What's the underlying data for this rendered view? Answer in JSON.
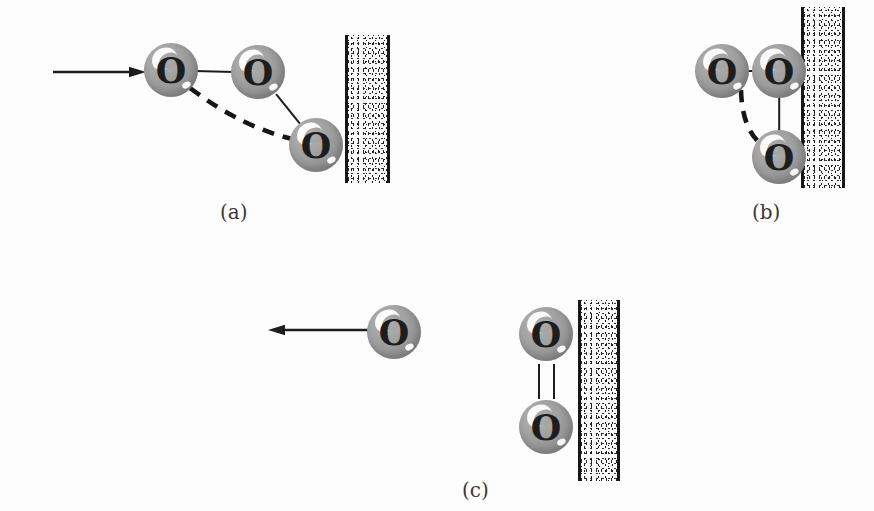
{
  "figure": {
    "background_color": "#fdfdfd",
    "atom_color": "#9a9a9a",
    "atom_label": "O",
    "bond_color": "#1c1c1c",
    "wall_edge_color": "#161616",
    "caption_color": "#3a3a3a"
  },
  "panels": [
    {
      "id": "a",
      "caption": "(a)",
      "caption_x": 220,
      "caption_y": 200,
      "stage_name": "ozone-approaching-surface",
      "incoming_arrow": {
        "name": "incoming-velocity-arrow",
        "x1": 53,
        "y1": 72,
        "x2": 146,
        "y2": 72,
        "direction": "right"
      },
      "atoms": [
        {
          "name": "atom-o1",
          "label": "O",
          "cx": 171,
          "cy": 70,
          "r": 27
        },
        {
          "name": "atom-o2",
          "label": "O",
          "cx": 258,
          "cy": 72,
          "r": 27
        },
        {
          "name": "atom-o3",
          "label": "O",
          "cx": 316,
          "cy": 145,
          "r": 27
        }
      ],
      "bonds": [
        {
          "name": "bond-o1-o2",
          "style": "solid",
          "x1": 195,
          "y1": 71,
          "x2": 234,
          "y2": 72
        },
        {
          "name": "bond-o2-o3",
          "style": "solid",
          "x1": 276,
          "y1": 94,
          "x2": 300,
          "y2": 124
        }
      ],
      "dashed_curve": {
        "name": "dashed-bond-path",
        "path": "M 190 88 Q 243 128 296 140"
      },
      "wall": {
        "name": "surface-wall",
        "x": 345,
        "y": 35,
        "width": 45,
        "height": 148
      }
    },
    {
      "id": "b",
      "caption": "(b)",
      "caption_x": 752,
      "caption_y": 200,
      "stage_name": "ozone-adsorbed-at-surface",
      "atoms": [
        {
          "name": "atom-o1",
          "label": "O",
          "cx": 722,
          "cy": 71,
          "r": 27
        },
        {
          "name": "atom-o2",
          "label": "O",
          "cx": 779,
          "cy": 71,
          "r": 27
        },
        {
          "name": "atom-o3",
          "label": "O",
          "cx": 779,
          "cy": 157,
          "r": 27
        }
      ],
      "bonds": [
        {
          "name": "bond-o1-o2",
          "style": "solid",
          "x1": 748,
          "y1": 71,
          "x2": 754,
          "y2": 71
        },
        {
          "name": "bond-o2-o3",
          "style": "solid",
          "x1": 779,
          "y1": 97,
          "x2": 779,
          "y2": 131
        }
      ],
      "dashed_curve": {
        "name": "dashed-bond-path",
        "path": "M 741 90 Q 742 132 765 147"
      },
      "wall": {
        "name": "surface-wall",
        "x": 801,
        "y": 7,
        "width": 44,
        "height": 181
      }
    },
    {
      "id": "c",
      "caption": "(c)",
      "caption_x": 462,
      "caption_y": 478,
      "stage_name": "oxygen-atom-released-oxygen-molecule-remains",
      "outgoing_arrow": {
        "name": "outgoing-velocity-arrow",
        "x1": 374,
        "y1": 330,
        "x2": 268,
        "y2": 330,
        "direction": "left"
      },
      "atoms": [
        {
          "name": "atom-o-escaping",
          "label": "O",
          "cx": 394,
          "cy": 332,
          "r": 27
        },
        {
          "name": "atom-o2-upper",
          "label": "O",
          "cx": 546,
          "cy": 334,
          "r": 27
        },
        {
          "name": "atom-o2-lower",
          "label": "O",
          "cx": 546,
          "cy": 427,
          "r": 27
        }
      ],
      "double_bond": {
        "name": "double-bond-o2",
        "x_left": 538,
        "x_right": 553,
        "y1": 364,
        "y2": 399
      },
      "wall": {
        "name": "surface-wall",
        "x": 578,
        "y": 300,
        "width": 42,
        "height": 181
      }
    }
  ]
}
